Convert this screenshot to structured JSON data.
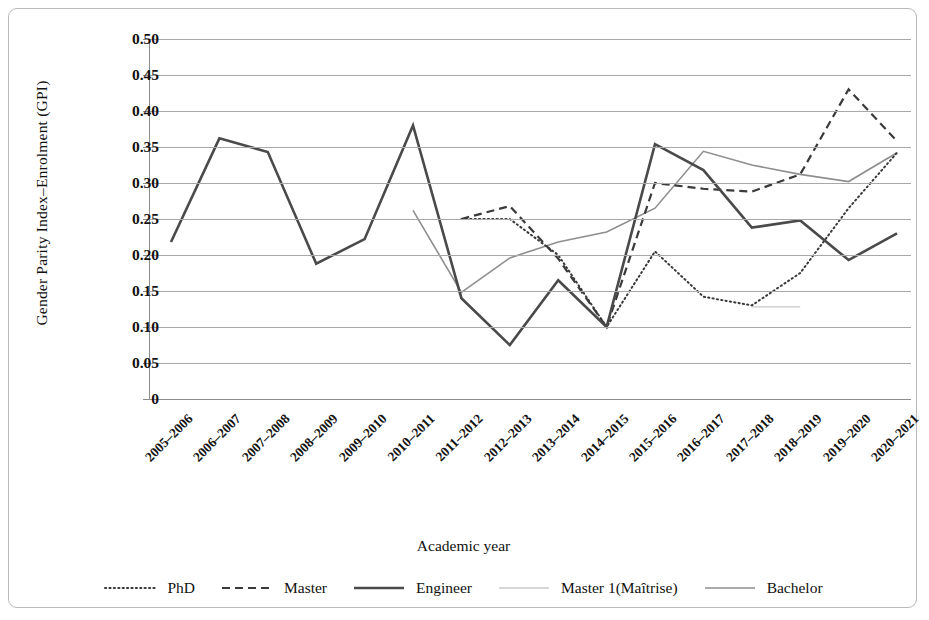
{
  "chart_data": {
    "type": "line",
    "title": "",
    "xlabel": "Academic year",
    "ylabel": "Gender Parity Index–Enrolment (GPI)",
    "ylim": [
      0,
      0.5
    ],
    "ytick_labels": [
      "0.50",
      "0.45",
      "0.40",
      "0.35",
      "0.30",
      "0.25",
      "0.20",
      "0.15",
      "0.10",
      "0.05",
      "0"
    ],
    "ytick_values": [
      0.5,
      0.45,
      0.4,
      0.35,
      0.3,
      0.25,
      0.2,
      0.15,
      0.1,
      0.05,
      0
    ],
    "grid": true,
    "legend_position": "bottom",
    "categories": [
      "2005–2006",
      "2006–2007",
      "2007–2008",
      "2008–2009",
      "2009–2010",
      "2010–2011",
      "2011–2012",
      "2012–2013",
      "2013–2014",
      "2014–2015",
      "2015–2016",
      "2016–2017",
      "2017–2018",
      "2018–2019",
      "2019–2020",
      "2020–2021"
    ],
    "series": [
      {
        "name": "PhD",
        "style": "dotted",
        "color": "#3a3a3a",
        "values": [
          null,
          null,
          null,
          null,
          null,
          null,
          0.25,
          0.25,
          0.2,
          0.1,
          0.205,
          0.142,
          0.13,
          0.175,
          0.265,
          0.342
        ]
      },
      {
        "name": "Master",
        "style": "dashed",
        "color": "#3a3a3a",
        "values": [
          null,
          null,
          null,
          null,
          null,
          null,
          0.25,
          0.268,
          0.195,
          0.1,
          0.3,
          0.292,
          0.288,
          0.312,
          0.43,
          0.358
        ]
      },
      {
        "name": "Engineer",
        "style": "solid-thick",
        "color": "#4a4a4a",
        "values": [
          0.218,
          0.362,
          0.343,
          0.188,
          0.222,
          0.38,
          0.14,
          0.075,
          0.165,
          0.1,
          0.354,
          0.318,
          0.238,
          0.248,
          0.193,
          0.23
        ]
      },
      {
        "name": "Master 1(Maîtrise)",
        "style": "solid-light",
        "color": "#c9c9c9",
        "values": [
          null,
          null,
          null,
          null,
          null,
          null,
          null,
          null,
          null,
          null,
          null,
          null,
          0.128,
          0.128,
          null,
          null
        ]
      },
      {
        "name": "Bachelor",
        "style": "solid-medium",
        "color": "#8e8e8e",
        "values": [
          null,
          null,
          null,
          null,
          null,
          0.262,
          0.148,
          0.196,
          0.218,
          0.232,
          0.265,
          0.344,
          0.325,
          0.312,
          0.302,
          0.342
        ]
      }
    ]
  }
}
